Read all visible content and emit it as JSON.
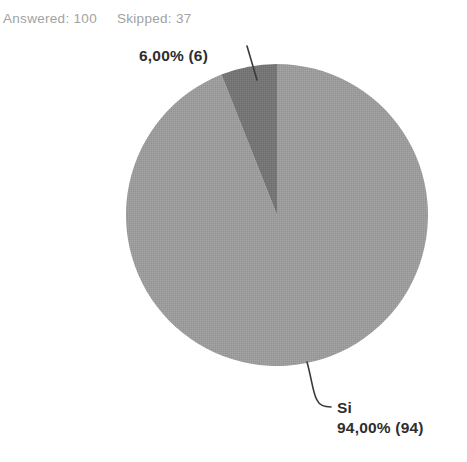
{
  "header": {
    "answered_text": "Answered: 100",
    "skipped_text": "Skipped: 37"
  },
  "chart_data": {
    "type": "pie",
    "title": "",
    "answered": 100,
    "skipped": 37,
    "start_angle_deg": 0,
    "direction": "clockwise",
    "legend_position": "none",
    "slices": [
      {
        "label": "Si",
        "percent": 94.0,
        "count": 94,
        "display_value": "94,00% (94)",
        "color": "#9d9d9d"
      },
      {
        "label": "",
        "percent": 6.0,
        "count": 6,
        "display_value": "6,00% (6)",
        "color": "#757575"
      }
    ],
    "leader_line_color": "#3a3a3a",
    "label_text_color": "#2e2e2e",
    "stats_text_color": "#a2a2a2"
  },
  "labels": {
    "small_slice_value": "6,00% (6)",
    "large_slice_name": "Si",
    "large_slice_value": "94,00% (94)"
  }
}
